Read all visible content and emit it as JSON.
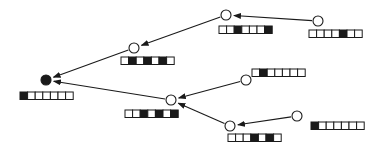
{
  "diagram": {
    "type": "tree",
    "colors": {
      "stroke": "#1a1a1a",
      "fill_on": "#1a1a1a",
      "fill_off": "#ffffff"
    },
    "nodes": [
      {
        "id": "root",
        "filled": true,
        "bits": "1000000"
      },
      {
        "id": "a",
        "filled": false,
        "bits": "0101010"
      },
      {
        "id": "b",
        "filled": false,
        "bits": "0010001"
      },
      {
        "id": "c",
        "filled": false,
        "bits": "0000100"
      },
      {
        "id": "d",
        "filled": false,
        "bits": "0010101"
      },
      {
        "id": "e",
        "filled": false,
        "bits": "0100000"
      },
      {
        "id": "f",
        "filled": false,
        "bits": "0001010"
      },
      {
        "id": "g",
        "filled": false,
        "bits": "1000000"
      }
    ],
    "edges": [
      {
        "from": "a",
        "to": "root"
      },
      {
        "from": "d",
        "to": "root"
      },
      {
        "from": "b",
        "to": "a"
      },
      {
        "from": "c",
        "to": "b"
      },
      {
        "from": "e",
        "to": "d"
      },
      {
        "from": "f",
        "to": "d"
      },
      {
        "from": "g",
        "to": "f"
      }
    ]
  }
}
